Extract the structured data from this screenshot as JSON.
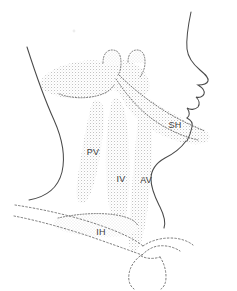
{
  "figure": {
    "background_color": "#ffffff",
    "outline_color": "#4a4a4a",
    "stipple_color": "#b9b9b9",
    "dotted_color": "#6b6b6b",
    "label_color": "#3a3a3a",
    "width": 237,
    "height": 291
  },
  "labels": [
    {
      "id": "SH",
      "text": "SH",
      "x": 175,
      "y": 128
    },
    {
      "id": "PV",
      "text": "PV",
      "x": 93,
      "y": 155
    },
    {
      "id": "IV",
      "text": "IV",
      "x": 121,
      "y": 182
    },
    {
      "id": "AV",
      "text": "AV",
      "x": 146,
      "y": 183
    },
    {
      "id": "IH",
      "text": "IH",
      "x": 101,
      "y": 235
    }
  ],
  "regions": [
    {
      "id": "submandibular-band",
      "label": null
    },
    {
      "id": "SH",
      "label": "SH"
    },
    {
      "id": "PV",
      "label": "PV"
    },
    {
      "id": "IV",
      "label": "IV"
    },
    {
      "id": "AV",
      "label": "AV"
    },
    {
      "id": "IH",
      "label": "IH"
    },
    {
      "id": "submental-node-left",
      "label": null
    },
    {
      "id": "submental-node-right",
      "label": null
    }
  ],
  "contours": [
    {
      "id": "face-profile"
    },
    {
      "id": "anterior-neck-contour"
    },
    {
      "id": "posterior-neck-contour"
    },
    {
      "id": "clavicle-upper"
    },
    {
      "id": "clavicle-lower"
    },
    {
      "id": "sternal-notch"
    }
  ]
}
